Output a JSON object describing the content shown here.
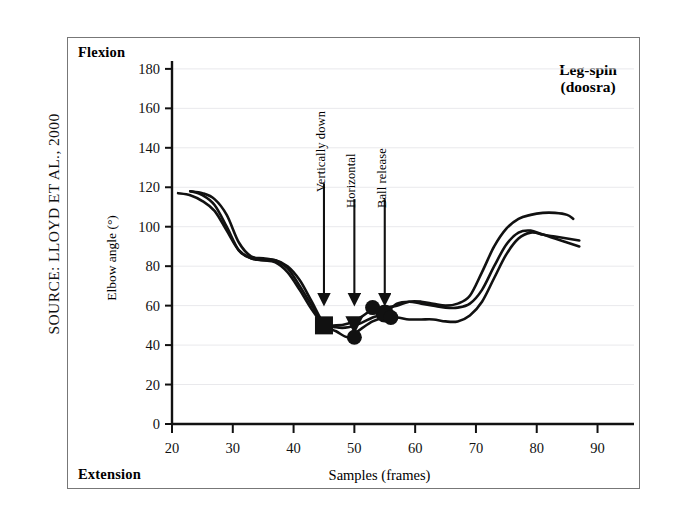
{
  "source_credit": {
    "prefix": "S",
    "text": "SOURCE: LLOYD ET AL., 2000",
    "full": "Source: Lloyd et al., 2000"
  },
  "chart": {
    "flexion_label": "Flexion",
    "extension_label": "Extension",
    "title_line1": "Leg-spin",
    "title_line2": "(doosra)"
  },
  "chart_data": {
    "type": "line",
    "title": "Leg-spin (doosra)",
    "xlabel": "Samples (frames)",
    "ylabel": "Elbow angle (°)",
    "xlim": [
      20,
      96
    ],
    "ylim": [
      0,
      184
    ],
    "xticks": [
      20,
      30,
      40,
      50,
      60,
      70,
      80,
      90
    ],
    "yticks": [
      0,
      20,
      40,
      60,
      80,
      100,
      120,
      140,
      160,
      180
    ],
    "grid": "horizontal-faint",
    "legend": "none",
    "axis_end_labels": {
      "y_top": "Flexion",
      "y_bottom": "Extension"
    },
    "series": [
      {
        "name": "trial-1",
        "color": "#111111",
        "x": [
          21,
          23,
          25,
          27,
          29,
          31,
          33,
          35,
          37,
          39,
          41,
          43,
          45,
          47,
          49,
          51,
          53,
          55,
          57,
          59,
          61,
          63,
          65,
          67,
          69,
          71,
          73,
          75,
          77,
          79,
          81,
          83,
          85,
          87
        ],
        "y": [
          117,
          116,
          113,
          108,
          98,
          88,
          84,
          83,
          83,
          80,
          73,
          62,
          51,
          49,
          49,
          51,
          54,
          56,
          61,
          62,
          61,
          60,
          59,
          59,
          61,
          68,
          80,
          91,
          97,
          98,
          96,
          95,
          94,
          93
        ]
      },
      {
        "name": "trial-2",
        "color": "#111111",
        "x": [
          23,
          25,
          27,
          29,
          31,
          33,
          35,
          37,
          39,
          41,
          43,
          45,
          47,
          49,
          51,
          53,
          55,
          57,
          59,
          61,
          63,
          65,
          67,
          69,
          71,
          73,
          75,
          77,
          79,
          81,
          83,
          85,
          87
        ],
        "y": [
          118,
          116,
          111,
          100,
          88,
          84,
          83,
          82,
          77,
          68,
          58,
          50,
          47,
          44,
          48,
          52,
          54,
          54,
          53,
          53,
          53,
          52,
          52,
          55,
          62,
          74,
          86,
          94,
          97,
          96,
          94,
          92,
          90
        ]
      },
      {
        "name": "trial-3",
        "color": "#111111",
        "x": [
          23,
          25,
          27,
          29,
          31,
          33,
          35,
          37,
          39,
          41,
          43,
          45,
          47,
          49,
          51,
          53,
          55,
          57,
          59,
          61,
          63,
          65,
          67,
          69,
          71,
          73,
          75,
          77,
          79,
          81,
          83,
          85,
          86
        ],
        "y": [
          118,
          117,
          114,
          106,
          92,
          85,
          84,
          83,
          79,
          70,
          60,
          51,
          50,
          51,
          54,
          58,
          59,
          60,
          62,
          62,
          61,
          60,
          61,
          65,
          77,
          90,
          99,
          104,
          106,
          107,
          107,
          106,
          104
        ]
      }
    ],
    "event_markers": [
      {
        "label": "Vertically down",
        "x": 45,
        "y": 50,
        "shape": "square"
      },
      {
        "label": "Horizontal",
        "x": 50,
        "y": 50,
        "shape": "triangle"
      },
      {
        "label": "Ball release",
        "x": 55,
        "y": 56,
        "shape": "circle"
      }
    ],
    "annotations": [
      {
        "label": "Vertically down",
        "x": 45,
        "arrow_from_y": 122,
        "arrow_to_y": 63
      },
      {
        "label": "Horizontal",
        "x": 50,
        "arrow_from_y": 114,
        "arrow_to_y": 63
      },
      {
        "label": "Ball release",
        "x": 55,
        "arrow_from_y": 114,
        "arrow_to_y": 63
      }
    ]
  }
}
